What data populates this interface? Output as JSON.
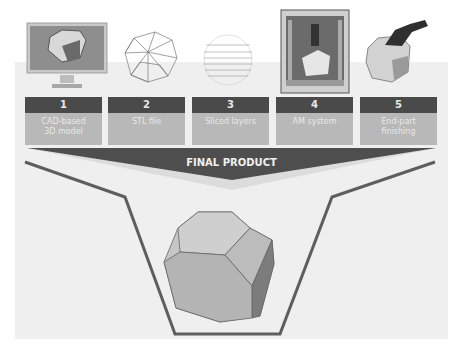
{
  "steps": [
    {
      "number": "1",
      "label": "CAD-based\n3D model",
      "icon": "computer-monitor-icon"
    },
    {
      "number": "2",
      "label": "STL file",
      "icon": "wireframe-mesh-icon"
    },
    {
      "number": "3",
      "label": "Sliced layers",
      "icon": "sliced-layers-icon"
    },
    {
      "number": "4",
      "label": "AM system",
      "icon": "3d-printer-icon"
    },
    {
      "number": "5",
      "label": "End-part\nfinishing",
      "icon": "finishing-tool-icon"
    }
  ],
  "final": {
    "label": "FINAL PRODUCT",
    "icon": "truncated-cube-icon"
  },
  "colors": {
    "header": "#4a4a4a",
    "label_bg": "#b8b8b8",
    "panel": "#efefef",
    "funnel": "#5e5e5e"
  }
}
